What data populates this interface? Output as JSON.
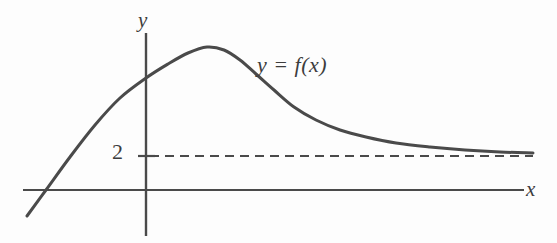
{
  "figure": {
    "kind": "math-graph",
    "background_color": "#fdfdfd",
    "ink_color": "#4a4a4a",
    "text_color": "#3d3d3d"
  },
  "labels": {
    "y_axis": "y",
    "x_axis": "x",
    "curve": "y = f(x)",
    "tick_2": "2"
  },
  "chart_data": {
    "type": "line",
    "title": "",
    "xlabel": "x",
    "ylabel": "y",
    "grid": false,
    "legend": "none",
    "annotations": [
      {
        "name": "curve-label",
        "text": "y = f(x)",
        "x_px": 257,
        "y_px": 54
      },
      {
        "name": "horizontal-asymptote-label",
        "text": "2",
        "value": 2,
        "x_px": 112,
        "y_px": 141
      }
    ],
    "asymptotes": [
      {
        "orientation": "horizontal",
        "value": 2,
        "style": "dashed",
        "label": "2",
        "y_px": 156,
        "x_start_px": 146,
        "x_end_px": 533
      }
    ],
    "axes": {
      "x_axis": {
        "y_px": 190,
        "x_start_px": 23,
        "x_end_px": 524,
        "arrow": false,
        "ticks": []
      },
      "y_axis": {
        "x_px": 146,
        "y_start_px": 33,
        "y_end_px": 236,
        "arrow": false,
        "ticks": [
          {
            "label": "2",
            "y_px": 156
          }
        ]
      }
    },
    "series": [
      {
        "name": "f",
        "label": "y = f(x)",
        "color": "#4a4a4a",
        "width_px": 3,
        "points_px": [
          {
            "x": 27,
            "y": 216
          },
          {
            "x": 46,
            "y": 190
          },
          {
            "x": 70,
            "y": 157
          },
          {
            "x": 95,
            "y": 125
          },
          {
            "x": 120,
            "y": 98
          },
          {
            "x": 146,
            "y": 78
          },
          {
            "x": 168,
            "y": 64
          },
          {
            "x": 188,
            "y": 53
          },
          {
            "x": 207,
            "y": 47
          },
          {
            "x": 224,
            "y": 50
          },
          {
            "x": 240,
            "y": 60
          },
          {
            "x": 256,
            "y": 74
          },
          {
            "x": 274,
            "y": 90
          },
          {
            "x": 294,
            "y": 107
          },
          {
            "x": 316,
            "y": 120
          },
          {
            "x": 340,
            "y": 130
          },
          {
            "x": 366,
            "y": 137
          },
          {
            "x": 396,
            "y": 143
          },
          {
            "x": 430,
            "y": 147
          },
          {
            "x": 465,
            "y": 150
          },
          {
            "x": 500,
            "y": 152
          },
          {
            "x": 533,
            "y": 153
          }
        ],
        "description": "rises from lower-left crossing the x-axis, peaks above the y-axis, then decays and approaches the horizontal asymptote y = 2 from above"
      }
    ],
    "notes": {
      "x_intercept_px": 46,
      "y_intercept_px": 78,
      "local_maximum_px": {
        "x": 207,
        "y": 47
      },
      "limit_at_infinity": 2
    }
  }
}
